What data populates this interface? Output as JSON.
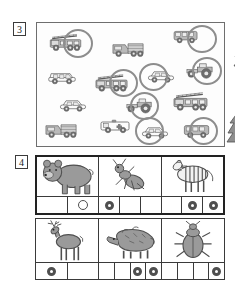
{
  "worksheet": {
    "exercises": [
      {
        "number": "3",
        "name": "circle-the-vehicles",
        "scene": {
          "items": [
            {
              "id": "fire-truck-1",
              "type": "fire-truck",
              "x": 12,
              "y": 10,
              "w": 34,
              "h": 20,
              "circled": true,
              "circle": {
                "x": 26,
                "y": 6,
                "w": 30,
                "h": 29
              }
            },
            {
              "id": "dump-truck-1",
              "type": "dump-truck",
              "x": 75,
              "y": 16,
              "w": 33,
              "h": 20,
              "circled": false
            },
            {
              "id": "bus-1",
              "type": "bus",
              "x": 136,
              "y": 5,
              "w": 26,
              "h": 17,
              "circled": true,
              "circle": {
                "x": 150,
                "y": 2,
                "w": 30,
                "h": 28
              }
            },
            {
              "id": "fir-tree-1",
              "type": "fir-tree",
              "x": 195,
              "y": 12,
              "w": 26,
              "h": 36,
              "circled": false
            },
            {
              "id": "van-1",
              "type": "van",
              "x": 10,
              "y": 45,
              "w": 30,
              "h": 18,
              "circled": false
            },
            {
              "id": "fire-truck-2",
              "type": "fire-truck",
              "x": 58,
              "y": 50,
              "w": 34,
              "h": 21,
              "circled": true,
              "circle": {
                "x": 72,
                "y": 46,
                "w": 29,
                "h": 28
              }
            },
            {
              "id": "car-1",
              "type": "car",
              "x": 110,
              "y": 44,
              "w": 28,
              "h": 18,
              "circled": true,
              "circle": {
                "x": 102,
                "y": 40,
                "w": 29,
                "h": 28
              }
            },
            {
              "id": "tractor-1",
              "type": "tractor",
              "x": 148,
              "y": 38,
              "w": 30,
              "h": 19,
              "circled": true,
              "circle": {
                "x": 155,
                "y": 34,
                "w": 30,
                "h": 28
              }
            },
            {
              "id": "car-2",
              "type": "car",
              "x": 22,
              "y": 73,
              "w": 28,
              "h": 18,
              "circled": false
            },
            {
              "id": "tractor-2",
              "type": "tractor",
              "x": 88,
              "y": 73,
              "w": 29,
              "h": 19,
              "circled": true,
              "circle": {
                "x": 93,
                "y": 69,
                "w": 29,
                "h": 28
              }
            },
            {
              "id": "fire-truck-3",
              "type": "fire-truck",
              "x": 136,
              "y": 68,
              "w": 36,
              "h": 22,
              "circled": false
            },
            {
              "id": "dump-truck-2",
              "type": "dump-truck",
              "x": 8,
              "y": 97,
              "w": 33,
              "h": 20,
              "circled": false
            },
            {
              "id": "ambulance-1",
              "type": "ambulance",
              "x": 63,
              "y": 94,
              "w": 31,
              "h": 19,
              "circled": false
            },
            {
              "id": "car-3",
              "type": "car",
              "x": 104,
              "y": 100,
              "w": 28,
              "h": 18,
              "circled": true,
              "circle": {
                "x": 98,
                "y": 94,
                "w": 29,
                "h": 28
              }
            },
            {
              "id": "bus-2",
              "type": "bus",
              "x": 146,
              "y": 99,
              "w": 28,
              "h": 18,
              "circled": true,
              "circle": {
                "x": 152,
                "y": 94,
                "w": 29,
                "h": 28
              }
            },
            {
              "id": "fir-tree-2",
              "type": "fir-tree",
              "x": 188,
              "y": 88,
              "w": 26,
              "h": 36,
              "circled": false
            }
          ]
        }
      },
      {
        "number": "4",
        "name": "count-syllables",
        "rows": [
          {
            "cells": [
              {
                "animal": "bear",
                "boxes": [
                  {
                    "mark": "none"
                  },
                  {
                    "mark": "hollow"
                  }
                ]
              },
              {
                "animal": "ant",
                "boxes": [
                  {
                    "mark": "filled"
                  },
                  {
                    "mark": "none"
                  },
                  {
                    "mark": "none"
                  }
                ]
              },
              {
                "animal": "zebra",
                "boxes": [
                  {
                    "mark": "none"
                  },
                  {
                    "mark": "filled"
                  },
                  {
                    "mark": "filled"
                  }
                ]
              }
            ]
          },
          {
            "cells": [
              {
                "animal": "deer",
                "boxes": [
                  {
                    "mark": "filled"
                  },
                  {
                    "mark": "none"
                  }
                ]
              },
              {
                "animal": "boar",
                "boxes": [
                  {
                    "mark": "none"
                  },
                  {
                    "mark": "none"
                  },
                  {
                    "mark": "filled"
                  },
                  {
                    "mark": "filled"
                  }
                ]
              },
              {
                "animal": "beetle",
                "boxes": [
                  {
                    "mark": "none"
                  },
                  {
                    "mark": "none"
                  },
                  {
                    "mark": "none"
                  },
                  {
                    "mark": "filled"
                  }
                ]
              }
            ]
          }
        ]
      }
    ]
  },
  "colors": {
    "ink": "#3b3b3b",
    "line": "#4a4a4a",
    "mark": "#4f4f4f",
    "vehicle_fill": "#b9b9b9",
    "tree_fill": "#8e8e8e",
    "animal_fill": "#9a9a9a",
    "page": "#ffffff"
  }
}
